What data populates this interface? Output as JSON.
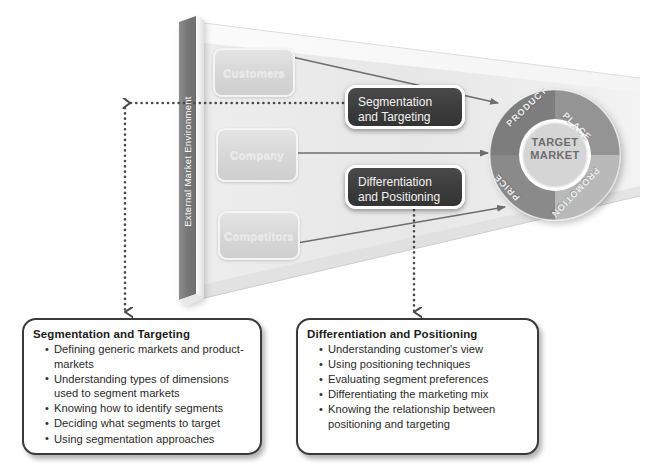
{
  "diagram": {
    "environment_label": "External Market Environment",
    "inner_boxes": [
      {
        "id": "customers",
        "label": "Customers"
      },
      {
        "id": "company",
        "label": "Company"
      },
      {
        "id": "competitors",
        "label": "Competitors"
      }
    ],
    "strategy_boxes": [
      {
        "id": "segmentation",
        "line1": "Segmentation",
        "line2": "and Targeting"
      },
      {
        "id": "differentiation",
        "line1": "Differentiation",
        "line2": "and Positioning"
      }
    ],
    "wheel": {
      "center_line1": "TARGET",
      "center_line2": "MARKET",
      "quadrants": [
        {
          "id": "product",
          "label": "PRODUCT",
          "color": "#7d7d7d"
        },
        {
          "id": "place",
          "label": "PLACE",
          "color": "#949494"
        },
        {
          "id": "promotion",
          "label": "PROMOTION",
          "color": "#b9b9b9"
        },
        {
          "id": "price",
          "label": "PRICE",
          "color": "#8a8a8a"
        }
      ],
      "center_color": "#d5d5d5"
    },
    "callouts": [
      {
        "id": "segmentation",
        "heading": "Segmentation and Targeting",
        "items": [
          "Defining generic markets and product-markets",
          "Understanding types of dimensions used to segment markets",
          "Knowing how to identify segments",
          "Deciding what segments to target",
          "Using segmentation approaches"
        ]
      },
      {
        "id": "differentiation",
        "heading": "Differentiation and Positioning",
        "items": [
          "Understanding customer's view",
          "Using positioning techniques",
          "Evaluating segment preferences",
          "Differentiating the marketing mix",
          "Knowing the relationship between positioning and targeting"
        ]
      }
    ],
    "connectors": {
      "solid_arrows": [
        {
          "id": "customers-to-wheel",
          "from": "customers",
          "to": "target-market"
        },
        {
          "id": "company-to-wheel",
          "from": "company",
          "to": "target-market"
        },
        {
          "id": "competitors-to-wheel",
          "from": "competitors",
          "to": "target-market"
        }
      ],
      "dotted_arrows": [
        {
          "id": "segmentation-to-callout",
          "from": "segmentation-box",
          "to": "segmentation-callout"
        },
        {
          "id": "differentiation-to-callout",
          "from": "differentiation-box",
          "to": "differentiation-callout"
        }
      ]
    },
    "colors": {
      "dark_box": "#3b3b3b",
      "env_bar": "#7a7a7a",
      "funnel": "#e9e9e9",
      "arrow": "#6e6e6e",
      "dotted": "#4a4a4a"
    }
  }
}
